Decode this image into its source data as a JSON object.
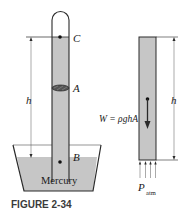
{
  "figure": {
    "caption": "FIGURE 2-34",
    "barometer": {
      "point_top": "C",
      "point_middle": "A",
      "point_bottom": "B",
      "height_label": "h",
      "fluid_label": "Mercury"
    },
    "free_body": {
      "weight_label": "W = ρghA",
      "height_label": "h",
      "pressure_label": "P",
      "pressure_subscript": "atm"
    },
    "colors": {
      "mercury_fill": "#c6c6c6",
      "outline": "#2a2a2a",
      "caption": "#3a3a3a"
    }
  }
}
